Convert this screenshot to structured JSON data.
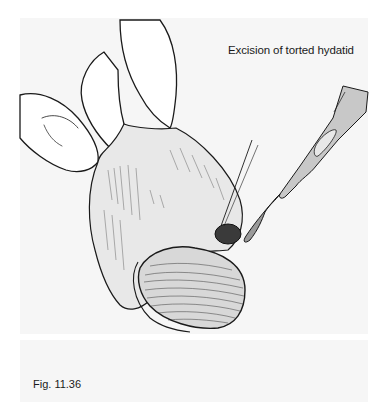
{
  "figure": {
    "title": "Excision of torted hydatid",
    "label": "Fig. 11.36",
    "panel_color": "#f6f6f6",
    "ink_color": "#1a1a1a",
    "illustration": {
      "subject": "surgical line drawing",
      "elements": [
        "fingers-holding-testis",
        "testis",
        "torted-hydatid",
        "suture-needle",
        "scalpel"
      ]
    }
  }
}
